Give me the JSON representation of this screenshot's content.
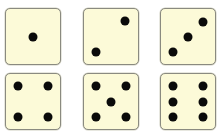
{
  "dice": [
    {
      "value": 1,
      "label": "one",
      "pips": [
        [
          50,
          50
        ]
      ]
    },
    {
      "value": 2,
      "label": "two",
      "pips": [
        [
          76,
          21
        ],
        [
          22,
          78
        ]
      ]
    },
    {
      "value": 3,
      "label": "three",
      "pips": [
        [
          78,
          23
        ],
        [
          50,
          50
        ],
        [
          22,
          79
        ]
      ]
    },
    {
      "value": 4,
      "label": "four",
      "pips": [
        [
          22,
          22
        ],
        [
          78,
          22
        ],
        [
          22,
          78
        ],
        [
          78,
          78
        ]
      ]
    },
    {
      "value": 5,
      "label": "five",
      "pips": [
        [
          22,
          22
        ],
        [
          78,
          22
        ],
        [
          50,
          50
        ],
        [
          22,
          78
        ],
        [
          78,
          78
        ]
      ]
    },
    {
      "value": 6,
      "label": "six",
      "pips": [
        [
          22,
          22
        ],
        [
          78,
          22
        ],
        [
          22,
          50
        ],
        [
          78,
          50
        ],
        [
          22,
          78
        ],
        [
          78,
          78
        ]
      ]
    }
  ],
  "colors": {
    "face": "#fcfad8",
    "pip": "#0a0a0a",
    "border": "#8a8a80"
  }
}
